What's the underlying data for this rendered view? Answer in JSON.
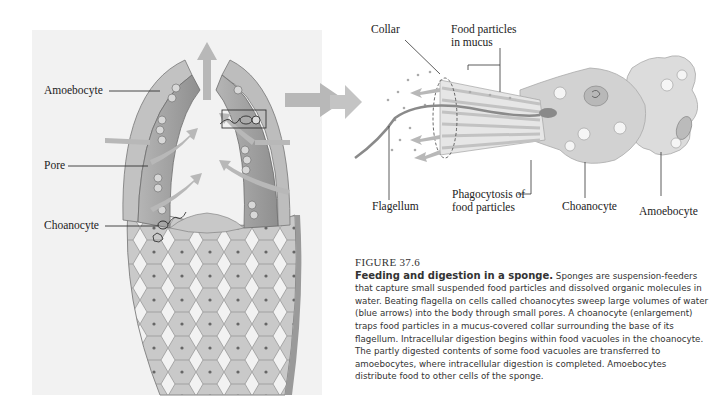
{
  "figure": {
    "number_label": "FIGURE 37.6",
    "title": "Feeding and digestion in a sponge.",
    "body": " Sponges are suspension-feeders that capture small suspended food particles and dissolved organic molecules in water. Beating flagella on cells called choanocytes sweep large volumes of water (blue arrows) into the body through small pores. A choanocyte (enlargement) traps food particles in a mucus-covered collar surrounding the base of its flagellum. Intracellular digestion begins within food vacuoles in the choanocyte. The partly digested contents of some food vacuoles are transferred to amoebocytes, where intracellular digestion is completed. Amoebocytes distribute food to other cells of the sponge."
  },
  "sponge_labels": {
    "amoebocyte": "Amoebocyte",
    "pore": "Pore",
    "choanocyte": "Choanocyte"
  },
  "enlargement_labels": {
    "collar": "Collar",
    "food_particles_line1": "Food particles",
    "food_particles_line2": "in mucus",
    "flagellum": "Flagellum",
    "phagocytosis_line1": "Phagocytosis of",
    "phagocytosis_line2": "food particles",
    "choanocyte": "Choanocyte",
    "amoebocyte": "Amoebocyte"
  },
  "colors": {
    "water_arrow": "#b8b8b8",
    "panel_bg": "#f2f2f2",
    "cell_fill": "#d6d6d6",
    "wall_fill": "#a8a8a8"
  }
}
